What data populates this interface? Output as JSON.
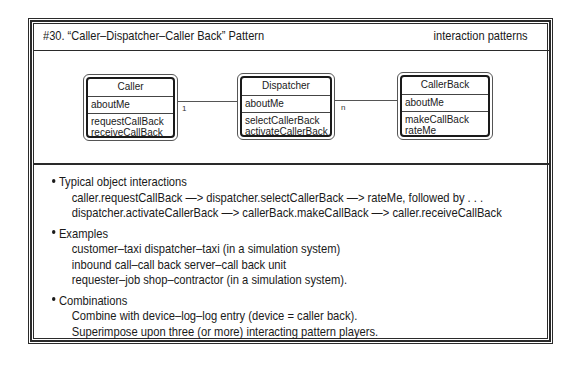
{
  "header": {
    "title": "#30. “Caller–Dispatcher–Caller Back” Pattern",
    "category": "interaction patterns"
  },
  "diagram": {
    "classes": [
      {
        "name": "Caller",
        "attributes": [
          "aboutMe"
        ],
        "services": [
          "requestCallBack",
          "receiveCallBack"
        ]
      },
      {
        "name": "Dispatcher",
        "attributes": [
          "aboutMe"
        ],
        "services": [
          "selectCallerBack",
          "activateCallerBack"
        ]
      },
      {
        "name": "CallerBack",
        "attributes": [
          "aboutMe"
        ],
        "services": [
          "makeCallBack",
          "rateMe"
        ]
      }
    ],
    "connections": [
      {
        "from": "Caller",
        "to": "Dispatcher",
        "label": "1"
      },
      {
        "from": "Dispatcher",
        "to": "CallerBack",
        "label": "n"
      }
    ]
  },
  "notes": [
    {
      "heading": "Typical object interactions",
      "lines": [
        "caller.requestCallBack —> dispatcher.selectCallerBack —> rateMe, followed by . . .",
        "dispatcher.activateCallerBack —> callerBack.makeCallBack —> caller.receiveCallBack"
      ]
    },
    {
      "heading": "Examples",
      "lines": [
        "customer–taxi dispatcher–taxi (in a simulation system)",
        "inbound call–call back server–call back unit",
        "requester–job shop–contractor (in a simulation system)."
      ]
    },
    {
      "heading": "Combinations",
      "lines": [
        "Combine with device–log–log entry (device = caller back).",
        "Superimpose upon three (or more) interacting pattern players."
      ]
    }
  ]
}
